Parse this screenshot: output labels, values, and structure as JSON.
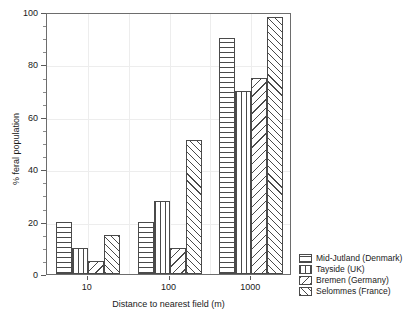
{
  "chart_data": {
    "type": "bar",
    "title": "",
    "subtitle": "",
    "xlabel": "Distance to nearest field (m)",
    "ylabel": "% feral population",
    "categories": [
      "10",
      "100",
      "1000"
    ],
    "ylim": [
      0,
      100
    ],
    "yticks": [
      0,
      20,
      40,
      60,
      80,
      100
    ],
    "ytick_labels": [
      "0",
      "20",
      "40",
      "60",
      "80",
      "100"
    ],
    "y_minor_tick_step": 5,
    "grid": true,
    "grid_axis": "both",
    "legend_position": "right-bottom-outside",
    "series": [
      {
        "name": "Mid-Jutland (Denmark)",
        "pattern": "horizontal-lines",
        "values": [
          20,
          20,
          90
        ]
      },
      {
        "name": "Tayside (UK)",
        "pattern": "vertical-lines",
        "values": [
          10,
          28,
          70
        ]
      },
      {
        "name": "Bremen (Germany)",
        "pattern": "diagonal-backslash",
        "values": [
          5,
          10,
          75
        ]
      },
      {
        "name": "Selommes (France)",
        "pattern": "diagonal-forwardslash",
        "values": [
          15,
          51,
          98
        ]
      }
    ],
    "colors": {
      "bar_edge": "#4a4a4a",
      "bar_fill": "#ffffff",
      "axis": "#6d6d6d",
      "grid": "#ededed",
      "text": "#1a1a1a"
    }
  }
}
